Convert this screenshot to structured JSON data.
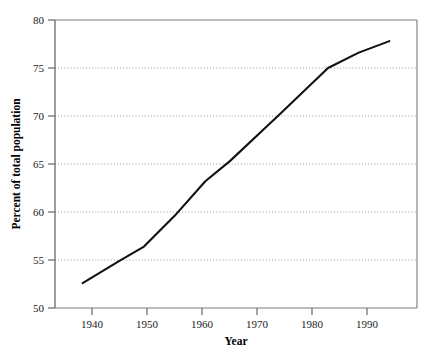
{
  "chart_data": {
    "type": "line",
    "title": "",
    "subtitle": "",
    "xlabel": "Year",
    "ylabel": "Percent of total population",
    "x": [
      1940,
      1946,
      1950,
      1955,
      1960,
      1964,
      1970,
      1972,
      1980,
      1985,
      1990
    ],
    "values": [
      52.6,
      54.9,
      56.4,
      59.6,
      63.2,
      65.3,
      68.9,
      70.1,
      75.0,
      76.6,
      77.8
    ],
    "series": [
      {
        "name": "Percent of total population",
        "color": "#111111",
        "values": [
          52.6,
          54.9,
          56.4,
          59.6,
          63.2,
          65.3,
          68.9,
          70.1,
          75.0,
          76.6,
          77.8
        ]
      }
    ],
    "xlim": [
      1935.5,
      1994.5
    ],
    "ylim": [
      50,
      80
    ],
    "xticks": [
      1940,
      1950,
      1960,
      1970,
      1980,
      1990
    ],
    "xtick_labels": [
      "1940",
      "1950",
      "1960",
      "1970",
      "1980",
      "1990"
    ],
    "yticks": [
      50,
      55,
      60,
      65,
      70,
      75,
      80
    ],
    "ytick_labels": [
      "50",
      "55",
      "60",
      "65",
      "70",
      "75",
      "80"
    ],
    "gridlines": {
      "horizontal_at": [
        55,
        60,
        65,
        70,
        75
      ],
      "vertical": false,
      "style": "dotted",
      "color": "#9a9a9a"
    },
    "legend": {
      "visible": false,
      "position": "none"
    },
    "frame": {
      "visible": true,
      "color": "#7a7a7a"
    },
    "background": "#ffffff",
    "annotations": []
  },
  "colors": {
    "line": "#111111",
    "grid": "#9a9a9a",
    "frame": "#7a7a7a",
    "text": "#1a1a1a",
    "background": "#ffffff"
  }
}
